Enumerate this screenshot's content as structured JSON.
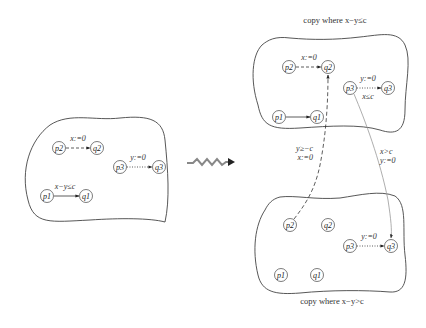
{
  "diagram": {
    "left_automaton": {
      "nodes": {
        "p2": "p2",
        "q2": "q2",
        "p3": "p3",
        "q3": "q3",
        "p1": "p1",
        "q1": "q1"
      },
      "edges": {
        "p2_q2": "x:=0",
        "p3_q3": "y:=0",
        "p1_q1": "x−y≤c"
      }
    },
    "transform_arrow": "squiggly-arrow",
    "top_copy": {
      "caption": "copy where x−y≤c",
      "nodes": {
        "p2": "p2",
        "q2": "q2",
        "p3": "p3",
        "q3": "q3",
        "p1": "p1",
        "q1": "q1"
      },
      "edges": {
        "p2_q2": "x:=0",
        "p3_q3_top": "y:=0",
        "p3_q3_bottom": "x≤c"
      }
    },
    "bottom_copy": {
      "caption": "copy where x−y>c",
      "nodes": {
        "p2": "p2",
        "q2": "q2",
        "p3": "p3",
        "q3": "q3",
        "p1": "p1",
        "q1": "q1"
      },
      "edges": {
        "p3_q3": "y:=0"
      }
    },
    "cross_edges": {
      "bottom_p2_to_top_q2_line1": "y≥−c",
      "bottom_p2_to_top_q2_line2": "x:=0",
      "top_p3_to_bottom_q3_line1": "x>c",
      "top_p3_to_bottom_q3_line2": "y:=0"
    }
  }
}
